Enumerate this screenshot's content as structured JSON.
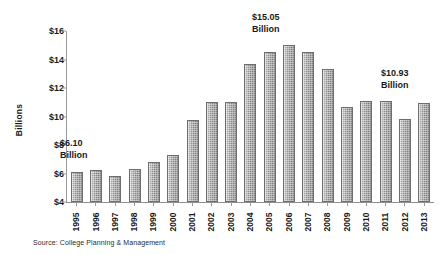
{
  "chart_data": {
    "type": "bar",
    "title": "",
    "xlabel": "",
    "ylabel": "Billions",
    "ylim": [
      4,
      16
    ],
    "ytick_values": [
      4,
      6,
      8,
      10,
      12,
      14,
      16
    ],
    "ytick_labels": [
      "$4",
      "$6",
      "$8",
      "$10",
      "$12",
      "$14",
      "$16"
    ],
    "grid": false,
    "legend": "none",
    "categories": [
      "1995",
      "1996",
      "1997",
      "1998",
      "1999",
      "2000",
      "2001",
      "2002",
      "2003",
      "2004",
      "2005",
      "2006",
      "2007",
      "2008",
      "2009",
      "2010",
      "2011",
      "2012",
      "2013"
    ],
    "values": [
      6.1,
      6.25,
      5.8,
      6.3,
      6.8,
      7.28,
      9.75,
      11.05,
      11.05,
      13.7,
      14.55,
      15.05,
      14.53,
      13.33,
      10.7,
      11.12,
      11.12,
      9.8,
      10.93
    ],
    "annotations": [
      {
        "name": "first-value",
        "value_label": "$6.10",
        "unit_label": "Billion",
        "category": "1995"
      },
      {
        "name": "peak-value",
        "value_label": "$15.05",
        "unit_label": "Billion",
        "category": "2006"
      },
      {
        "name": "last-value",
        "value_label": "$10.93",
        "unit_label": "Billion",
        "category": "2013"
      }
    ],
    "source": "Source: College Planning & Management",
    "bar_color": "#8c8c8c",
    "bar_edge_color": "#6e6e6e",
    "axis_color": "#9a9a9a",
    "text_color": "#1a1a1a",
    "background_color": "#ffffff"
  }
}
